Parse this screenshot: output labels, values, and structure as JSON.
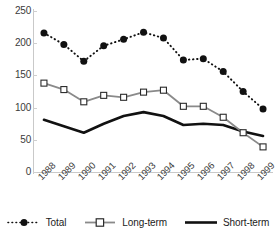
{
  "chart_data": {
    "type": "line",
    "title": "",
    "xlabel": "",
    "ylabel": "",
    "categories": [
      "1988",
      "1989",
      "1990",
      "1991",
      "1992",
      "1993",
      "1994",
      "1995",
      "1996",
      "1997",
      "1998",
      "1999"
    ],
    "ylim": [
      0,
      250
    ],
    "yticks": [
      0,
      50,
      100,
      150,
      200,
      250
    ],
    "grid": false,
    "legend_position": "bottom",
    "series": [
      {
        "name": "Total",
        "style": "dotted",
        "marker": "filled-circle",
        "color": "#111111",
        "values": [
          216,
          198,
          172,
          196,
          206,
          217,
          208,
          174,
          176,
          156,
          125,
          98
        ]
      },
      {
        "name": "Long-term",
        "style": "solid",
        "marker": "open-square",
        "color": "#8a8a8a",
        "values": [
          138,
          128,
          109,
          119,
          116,
          124,
          127,
          102,
          102,
          85,
          61,
          39
        ]
      },
      {
        "name": "Short-term",
        "style": "solid",
        "marker": "none",
        "color": "#111111",
        "values": [
          81,
          71,
          61,
          75,
          87,
          93,
          87,
          73,
          75,
          73,
          63,
          56
        ]
      }
    ]
  },
  "axis": {
    "y_tick_labels": [
      "250",
      "200",
      "150",
      "100",
      "50",
      "0"
    ],
    "x_tick_labels": [
      "1988",
      "1989",
      "1990",
      "1991",
      "1992",
      "1993",
      "1994",
      "1995",
      "1996",
      "1997",
      "1998",
      "1999"
    ]
  },
  "legend": {
    "items": [
      {
        "label": "Total",
        "swatch": "dotted-filled-circle-marker"
      },
      {
        "label": "Long-term",
        "swatch": "gray-line-open-square-marker"
      },
      {
        "label": "Short-term",
        "swatch": "solid-black-line"
      }
    ]
  }
}
